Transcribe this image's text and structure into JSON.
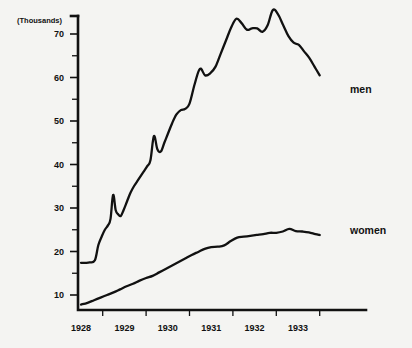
{
  "chart_data": {
    "type": "line",
    "title": "",
    "subtitle": "",
    "unit_label": "(Thousands)",
    "xlabel": "",
    "ylabel": "",
    "xlim": [
      1928.0,
      1933.6
    ],
    "ylim": [
      5,
      76
    ],
    "grid": false,
    "legend_position": "inline-right",
    "y_ticks_major": [
      10,
      20,
      30,
      40,
      50,
      60,
      70
    ],
    "y_ticks_minor": [
      15,
      25,
      35,
      45,
      55,
      65,
      75
    ],
    "y_tick_labels": [
      "10",
      "20",
      "30",
      "40",
      "50",
      "60",
      "70"
    ],
    "x_ticks_major": [
      1928,
      1929,
      1930,
      1931,
      1932,
      1933
    ],
    "x_tick_labels": [
      "1928",
      "1929",
      "1930",
      "1931",
      "1932",
      "1933"
    ],
    "x_ticks_minor": [
      1928.5,
      1929.5,
      1930.5,
      1931.5,
      1932.5,
      1933.5
    ],
    "series": [
      {
        "name": "men",
        "label": "men",
        "color": "#111111",
        "x": [
          1928.0,
          1928.1,
          1928.2,
          1928.32,
          1928.4,
          1928.48,
          1928.55,
          1928.62,
          1928.68,
          1928.74,
          1928.8,
          1928.86,
          1928.92,
          1928.98,
          1929.06,
          1929.14,
          1929.22,
          1929.32,
          1929.42,
          1929.52,
          1929.6,
          1929.68,
          1929.76,
          1929.84,
          1929.92,
          1930.0,
          1930.1,
          1930.2,
          1930.3,
          1930.4,
          1930.5,
          1930.62,
          1930.74,
          1930.86,
          1930.98,
          1931.1,
          1931.22,
          1931.34,
          1931.46,
          1931.58,
          1931.7,
          1931.82,
          1931.94,
          1932.06,
          1932.18,
          1932.3,
          1932.42,
          1932.54,
          1932.66,
          1932.78,
          1932.9,
          1933.02,
          1933.14,
          1933.26,
          1933.38,
          1933.5
        ],
        "values": [
          17.4,
          17.4,
          17.5,
          18.0,
          21.5,
          23.5,
          25.0,
          26.0,
          27.5,
          33.0,
          29.5,
          28.5,
          28.2,
          29.5,
          31.5,
          33.5,
          35.0,
          36.5,
          38.0,
          39.5,
          41.0,
          46.5,
          43.5,
          43.0,
          45.0,
          47.0,
          49.5,
          51.5,
          52.5,
          52.8,
          54.0,
          58.5,
          62.0,
          60.5,
          61.0,
          62.5,
          65.5,
          68.5,
          71.5,
          73.5,
          72.5,
          71.0,
          71.3,
          71.3,
          70.5,
          72.0,
          75.5,
          74.5,
          72.0,
          69.5,
          68.0,
          67.5,
          66.0,
          64.5,
          62.5,
          60.5
        ]
      },
      {
        "name": "women",
        "label": "women",
        "color": "#111111",
        "x": [
          1928.0,
          1928.15,
          1928.3,
          1928.45,
          1928.6,
          1928.75,
          1928.9,
          1929.05,
          1929.2,
          1929.35,
          1929.5,
          1929.65,
          1929.8,
          1929.95,
          1930.1,
          1930.25,
          1930.4,
          1930.55,
          1930.7,
          1930.85,
          1931.0,
          1931.15,
          1931.3,
          1931.45,
          1931.6,
          1931.75,
          1931.9,
          1932.05,
          1932.2,
          1932.35,
          1932.5,
          1932.65,
          1932.8,
          1932.95,
          1933.1,
          1933.25,
          1933.4,
          1933.5
        ],
        "values": [
          7.8,
          8.2,
          8.8,
          9.4,
          10.0,
          10.6,
          11.3,
          12.0,
          12.6,
          13.3,
          13.9,
          14.4,
          15.2,
          16.0,
          16.8,
          17.6,
          18.4,
          19.2,
          19.9,
          20.6,
          21.0,
          21.1,
          21.4,
          22.4,
          23.2,
          23.4,
          23.6,
          23.8,
          24.0,
          24.3,
          24.3,
          24.6,
          25.2,
          24.7,
          24.6,
          24.4,
          24.0,
          23.8
        ]
      }
    ],
    "annotations": [
      {
        "text": "men",
        "for_series": "men"
      },
      {
        "text": "women",
        "for_series": "women"
      }
    ]
  }
}
